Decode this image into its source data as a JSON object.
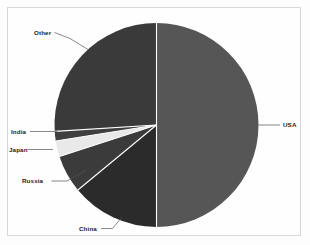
{
  "chart_data": {
    "type": "pie",
    "title": "",
    "subtitle": "",
    "xlabel": "",
    "ylabel": "",
    "legend_position": "none",
    "grid": false,
    "labels_position": "outside-with-leader-lines",
    "start_angle_deg": 0,
    "direction": "clockwise",
    "categories": [
      "USA",
      "China",
      "Russia",
      "Japan",
      "India",
      "Other"
    ],
    "values": [
      50.0,
      14.0,
      6.0,
      2.5,
      1.5,
      26.0
    ],
    "slices": [
      {
        "label": "USA",
        "value": 50.0,
        "color": "#565656",
        "start_deg": 0.0,
        "end_deg": 180.0
      },
      {
        "label": "China",
        "value": 14.0,
        "color": "#2b2b2b",
        "start_deg": 180.0,
        "end_deg": 230.4
      },
      {
        "label": "Russia",
        "value": 6.0,
        "color": "#3b3b3b",
        "start_deg": 230.4,
        "end_deg": 252.0
      },
      {
        "label": "Japan",
        "value": 2.5,
        "color": "#e9e9e9",
        "start_deg": 252.0,
        "end_deg": 261.0
      },
      {
        "label": "India",
        "value": 1.5,
        "color": "#3f3f3f",
        "start_deg": 261.0,
        "end_deg": 266.4
      },
      {
        "label": "Other",
        "value": 26.0,
        "color": "#3a3a3a",
        "start_deg": 266.4,
        "end_deg": 360.0
      }
    ]
  },
  "labels": {
    "usa": "USA",
    "china": "China",
    "russia": "Russia",
    "japan": "Japan",
    "india": "India",
    "other": "Other"
  },
  "colors": {
    "usa": "#565656",
    "china": "#2b2b2b",
    "russia": "#3b3b3b",
    "japan": "#e9e9e9",
    "india": "#3f3f3f",
    "other": "#3a3a3a",
    "background": "#fdfdfd",
    "frame_border": "#d8d8d8",
    "label_text": "#1b1b1b",
    "leader_line": "#555555"
  }
}
